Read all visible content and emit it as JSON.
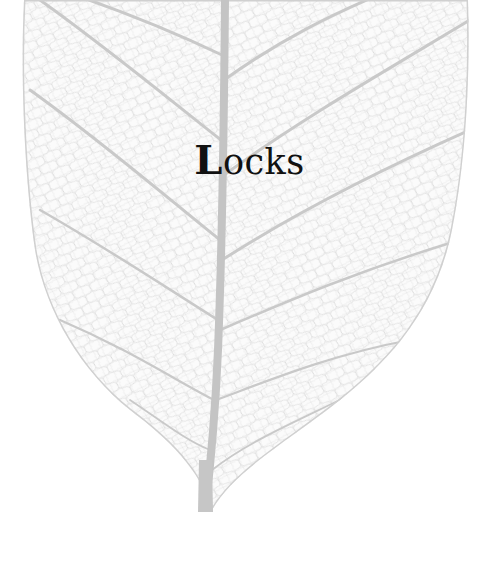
{
  "cover": {
    "title": "Locks",
    "title_initial": "L",
    "title_rest": "ocks"
  },
  "illustration": {
    "subject": "skeleton-leaf",
    "vein_color": "#c6c6c6",
    "mesh_color": "#dcdcdc",
    "background_color": "#ffffff"
  }
}
